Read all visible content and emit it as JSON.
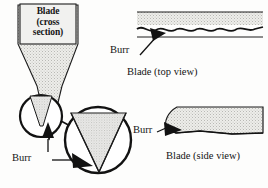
{
  "figure": {
    "background_color": "#fdfdfc",
    "ink_color": "#141414",
    "shade_color": "#d9d9d6"
  },
  "cross_section": {
    "label_line1": "Blade",
    "label_line2": "(cross",
    "label_line3": "section)",
    "burr_label": "Burr"
  },
  "top_view": {
    "burr_label": "Burr",
    "caption": "Blade (top view)"
  },
  "side_view": {
    "burr_label": "Burr",
    "caption": "Blade (side view)"
  }
}
